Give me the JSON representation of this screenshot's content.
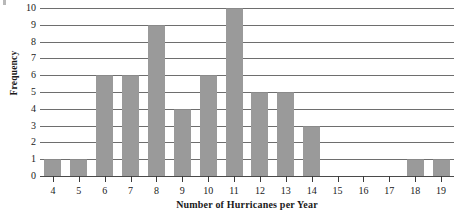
{
  "chart_data": {
    "type": "bar",
    "title": "",
    "subtitle": "",
    "xlabel": "Number of Hurricanes per Year",
    "ylabel": "Frequency",
    "categories": [
      "4",
      "5",
      "6",
      "7",
      "8",
      "9",
      "10",
      "11",
      "12",
      "13",
      "14",
      "15",
      "16",
      "17",
      "18",
      "19"
    ],
    "values": [
      1,
      1,
      6,
      6,
      9,
      4,
      6,
      10,
      5,
      5,
      3,
      0,
      0,
      0,
      1,
      1
    ],
    "series": [
      {
        "name": "Frequency",
        "values": [
          1,
          1,
          6,
          6,
          9,
          4,
          6,
          10,
          5,
          5,
          3,
          0,
          0,
          0,
          1,
          1
        ]
      }
    ],
    "ylim": [
      0,
      10
    ],
    "xlim_categories": [
      "4",
      "19"
    ],
    "yticks": [
      0,
      1,
      2,
      3,
      4,
      5,
      6,
      7,
      8,
      9,
      10
    ],
    "ytick_labels": [
      "0",
      "1",
      "2",
      "3",
      "4",
      "5",
      "6",
      "7",
      "8",
      "9",
      "10"
    ],
    "grid": "horizontal",
    "legend": "none",
    "bar_color": "#9a9a9a",
    "grid_color": "#6e6e6e",
    "background_color": "#ffffff",
    "annotations": []
  }
}
